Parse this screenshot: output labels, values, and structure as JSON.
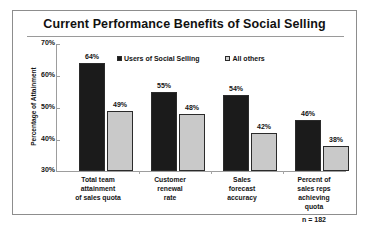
{
  "chart_data": {
    "type": "bar",
    "title": "Current Performance Benefits of Social Selling",
    "xlabel": "",
    "ylabel": "Percentage of Attainment",
    "ylim": [
      30,
      70
    ],
    "ytick_labels": [
      "70%",
      "60%",
      "50%",
      "40%",
      "30%"
    ],
    "yticks": [
      70,
      60,
      50,
      40,
      30
    ],
    "grid": false,
    "legend_position": "top-center",
    "categories": [
      "Total team attainment of sales quota",
      "Customer renewal rate",
      "Sales forecast accuracy",
      "Percent of sales reps achieving quota"
    ],
    "category_lines": [
      [
        "Total team",
        "attainment",
        "of sales quota"
      ],
      [
        "Customer",
        "renewal",
        "rate"
      ],
      [
        "Sales",
        "forecast",
        "accuracy"
      ],
      [
        "Percent of",
        "sales reps",
        "achieving",
        "quota"
      ]
    ],
    "series": [
      {
        "name": "Users of Social Selling",
        "color": "#1b1b1b",
        "values": [
          64,
          55,
          54,
          46
        ],
        "labels": [
          "64%",
          "55%",
          "54%",
          "46%"
        ]
      },
      {
        "name": "All others",
        "color": "#c9c9c9",
        "values": [
          49,
          48,
          42,
          38
        ],
        "labels": [
          "49%",
          "48%",
          "42%",
          "38%"
        ]
      }
    ],
    "annotation": "n = 182"
  }
}
